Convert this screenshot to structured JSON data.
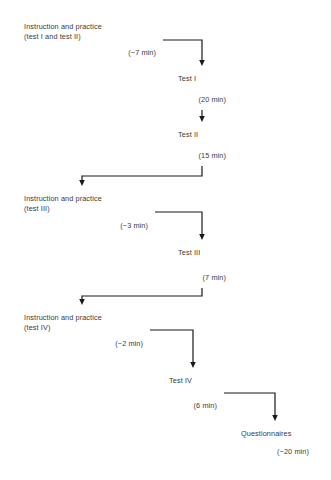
{
  "diagram": {
    "background_color": "#ffffff",
    "box_border_color": "#2b2b2b",
    "connector_color": "#1a1a1a",
    "text_color": "#3a3a3a",
    "nodes": [
      {
        "id": "instruction-practice-1",
        "line1": "Instruction and practice",
        "line2": "(test I and test II)",
        "duration": "(~7 min)",
        "x": 17,
        "y": 16,
        "w": 146,
        "h": 47
      },
      {
        "id": "test-1",
        "line1": "Test I",
        "line2": "",
        "duration": "(20 min)",
        "x": 171,
        "y": 68,
        "w": 62,
        "h": 42
      },
      {
        "id": "test-2",
        "line1": "Test II",
        "line2": "",
        "duration": "(15 min)",
        "x": 171,
        "y": 124,
        "w": 62,
        "h": 42
      },
      {
        "id": "instruction-practice-2",
        "line1": "Instruction and practice",
        "line2": "(test III)",
        "duration": "(~3 min)",
        "x": 17,
        "y": 188,
        "w": 138,
        "h": 48
      },
      {
        "id": "test-3",
        "line1": "Test III",
        "line2": "",
        "duration": "(7 min)",
        "x": 171,
        "y": 242,
        "w": 62,
        "h": 46
      },
      {
        "id": "instruction-practice-3",
        "line1": "Instruction and practice",
        "line2": "(test IV)",
        "duration": "(~2 min)",
        "x": 17,
        "y": 307,
        "w": 133,
        "h": 47
      },
      {
        "id": "test-4",
        "line1": "Test IV",
        "line2": "",
        "duration": "(6 min)",
        "x": 162,
        "y": 370,
        "w": 62,
        "h": 46
      },
      {
        "id": "questionnaires",
        "line1": "Questionnaires",
        "line2": "",
        "duration": "(~20 min)",
        "x": 234,
        "y": 423,
        "w": 82,
        "h": 39
      }
    ],
    "connectors": [
      {
        "id": "conn-instr1-to-test1",
        "from": "instruction-practice-1",
        "to": "test-1"
      },
      {
        "id": "conn-test1-to-test2",
        "from": "test-1",
        "to": "test-2"
      },
      {
        "id": "conn-test2-to-instr2",
        "from": "test-2",
        "to": "instruction-practice-2"
      },
      {
        "id": "conn-instr2-to-test3",
        "from": "instruction-practice-2",
        "to": "test-3"
      },
      {
        "id": "conn-test3-to-instr3",
        "from": "test-3",
        "to": "instruction-practice-3"
      },
      {
        "id": "conn-instr3-to-test4",
        "from": "instruction-practice-3",
        "to": "test-4"
      },
      {
        "id": "conn-test4-to-questionnaires",
        "from": "test-4",
        "to": "questionnaires"
      }
    ],
    "caption": ""
  }
}
